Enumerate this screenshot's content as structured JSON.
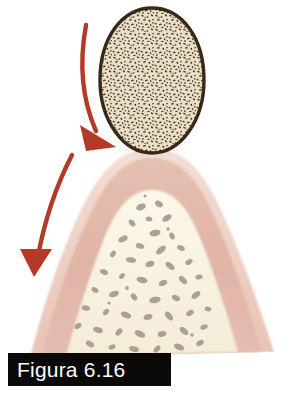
{
  "figure": {
    "caption": "Figura 6.16",
    "background_color": "#ffffff",
    "caption_box_color": "#0a0908",
    "caption_text_color": "#fdfdfd"
  },
  "illustration": {
    "title": "Figura 6.16",
    "type": "anatomical-illustration",
    "subject": "interdental gingiva and alveolar bone with ovoid speckled mass",
    "parts": [
      {
        "name": "speckled-ovoid-mass",
        "description": "egg-shaped speckled body resting on gingival apex",
        "fill_color": "#e7dcc0",
        "outline_color": "#3a2a1c",
        "speckle_color": "#4a3420",
        "center_x": 152,
        "center_y": 80,
        "radius_x": 52,
        "radius_y": 73
      },
      {
        "name": "outer-gingiva-band",
        "description": "pale pink outer gingival surface",
        "fill_color": "#f0d5cb"
      },
      {
        "name": "inner-gingiva-band",
        "description": "dusty rose connective tissue layer",
        "fill_color": "#e0b5a7"
      },
      {
        "name": "cancellous-bone",
        "description": "cream interior of alveolar bone with trabecular spaces",
        "fill_color": "#f7f2e2",
        "trabecula_color": "#a49a8c"
      },
      {
        "name": "arrow-upper",
        "description": "curved red arrow pointing down-right toward the gingival margin",
        "color": "#b33a26",
        "start_x": 86,
        "start_y": 25,
        "tip_x": 105,
        "tip_y": 146
      },
      {
        "name": "arrow-lower",
        "description": "curved red arrow pointing down-left away from the gingiva",
        "color": "#b33a26",
        "start_x": 72,
        "start_y": 155,
        "tip_x": 33,
        "tip_y": 272
      }
    ],
    "colors": {
      "arrow_red": "#b33a26",
      "bone_cream": "#f7f2e2",
      "gingiva_pink": "#f0d5cb",
      "gingiva_rose": "#e0b5a7",
      "mass_tan": "#e7dcc0",
      "mass_outline": "#3a2a1c",
      "trabecula_gray": "#a49a8c"
    }
  }
}
